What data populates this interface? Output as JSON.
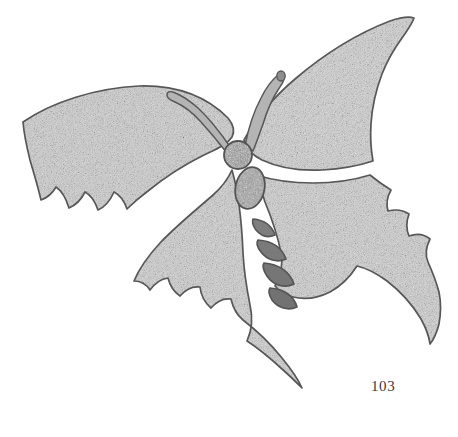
{
  "plate": {
    "number": "103",
    "background_color": "#ffffff",
    "ink_color": "#6d6d6d",
    "outline_color": "#5a5a5a",
    "wing_fill_color": "#b9b9b9",
    "body_fill_color": "#8a8a8a",
    "width": 458,
    "height": 437
  },
  "figure": {
    "style": "stippled engraving plate",
    "parts": [
      {
        "name": "left-forewing",
        "label": "left forewing"
      },
      {
        "name": "right-forewing",
        "label": "right forewing"
      },
      {
        "name": "left-hindwing",
        "label": "left hindwing"
      },
      {
        "name": "right-hindwing",
        "label": "right hindwing"
      },
      {
        "name": "left-antenna",
        "label": "left antenna"
      },
      {
        "name": "right-antenna",
        "label": "right antenna"
      },
      {
        "name": "head",
        "label": "head"
      },
      {
        "name": "thorax",
        "label": "thorax"
      },
      {
        "name": "abdomen-segment-1",
        "label": "abdomen segment 1"
      },
      {
        "name": "abdomen-segment-2",
        "label": "abdomen segment 2"
      },
      {
        "name": "abdomen-segment-3",
        "label": "abdomen segment 3"
      },
      {
        "name": "abdomen-segment-4",
        "label": "abdomen segment 4"
      }
    ]
  }
}
